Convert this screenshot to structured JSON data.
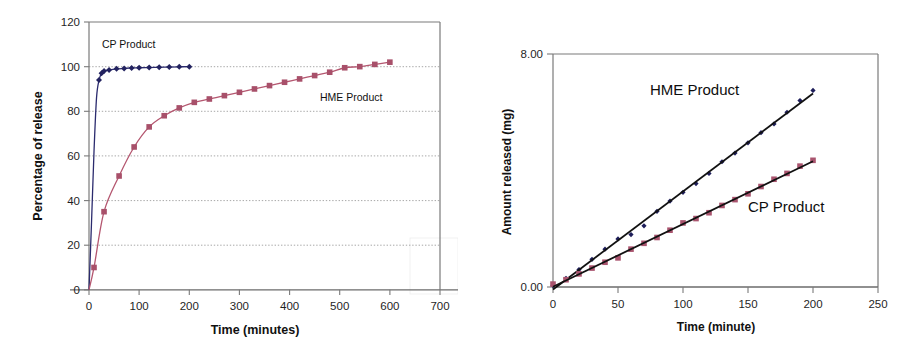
{
  "figure": {
    "panels": [
      "left-dissolution-percentage",
      "right-amount-released"
    ]
  },
  "chart_data": [
    {
      "id": "left",
      "type": "line",
      "title": "",
      "xlabel": "Time (minutes)",
      "ylabel": "Percentage of release",
      "xlim": [
        0,
        700
      ],
      "ylim": [
        0,
        120
      ],
      "xticks": [
        0,
        100,
        200,
        300,
        400,
        500,
        600,
        700
      ],
      "yticks": [
        0,
        20,
        40,
        60,
        80,
        100,
        120
      ],
      "grid": "horizontal-dotted",
      "legend": "inline-annotations",
      "annotations": [
        {
          "text": "CP Product",
          "x": 55,
          "y": 112
        },
        {
          "text": "HME Product",
          "x": 360,
          "y": 86
        }
      ],
      "series": [
        {
          "name": "CP Product",
          "color": "#232360",
          "marker": "diamond",
          "x": [
            0,
            5,
            10,
            15,
            20,
            25,
            30,
            40,
            55,
            70,
            85,
            100,
            120,
            140,
            160,
            180,
            200
          ],
          "y": [
            0,
            30,
            62,
            86,
            94,
            97,
            98,
            98.5,
            99,
            99.2,
            99.4,
            99.5,
            99.6,
            99.7,
            99.8,
            99.9,
            100
          ]
        },
        {
          "name": "HME Product",
          "color": "#a8506a",
          "marker": "square",
          "x": [
            0,
            10,
            30,
            60,
            90,
            120,
            150,
            180,
            210,
            240,
            270,
            300,
            330,
            360,
            390,
            420,
            450,
            480,
            510,
            540,
            570,
            600
          ],
          "y": [
            0,
            10,
            35,
            51,
            64,
            73,
            78,
            81.5,
            84,
            85.5,
            87,
            88.5,
            90,
            91.5,
            93,
            94.5,
            96,
            97.5,
            99.5,
            100,
            101,
            102
          ]
        }
      ]
    },
    {
      "id": "right",
      "type": "scatter-with-fit",
      "title": "",
      "xlabel": "Time (minute)",
      "ylabel": "Amount released (mg)",
      "xlim": [
        0,
        250
      ],
      "ylim": [
        0.0,
        8.0
      ],
      "xticks": [
        0,
        50,
        100,
        150,
        200,
        250
      ],
      "yticks": [
        "0.00",
        "8.00"
      ],
      "ytick_values": [
        0,
        8
      ],
      "grid": "none",
      "legend": "inline-annotations",
      "annotations": [
        {
          "text": "HME Product",
          "x": 105,
          "y": 6.9
        },
        {
          "text": "CP Product",
          "x": 160,
          "y": 2.6
        }
      ],
      "series": [
        {
          "name": "HME Product",
          "color": "#232360",
          "marker": "diamond",
          "fit_line": true,
          "x": [
            0,
            10,
            20,
            30,
            40,
            50,
            60,
            70,
            80,
            90,
            100,
            110,
            120,
            130,
            140,
            150,
            160,
            170,
            180,
            190,
            200
          ],
          "y": [
            0.05,
            0.3,
            0.6,
            0.95,
            1.3,
            1.65,
            1.8,
            2.1,
            2.6,
            2.95,
            3.25,
            3.55,
            3.9,
            4.3,
            4.6,
            4.95,
            5.3,
            5.6,
            6.0,
            6.4,
            6.75
          ]
        },
        {
          "name": "CP Product",
          "color": "#a8506a",
          "marker": "square",
          "fit_line": true,
          "x": [
            0,
            10,
            20,
            30,
            40,
            50,
            60,
            70,
            80,
            90,
            100,
            110,
            120,
            130,
            140,
            150,
            160,
            170,
            180,
            190,
            200
          ],
          "y": [
            0.1,
            0.25,
            0.45,
            0.65,
            0.85,
            1.0,
            1.3,
            1.5,
            1.7,
            1.95,
            2.2,
            2.35,
            2.55,
            2.8,
            3.0,
            3.2,
            3.45,
            3.7,
            3.9,
            4.15,
            4.35
          ]
        }
      ]
    }
  ],
  "left_chart": {
    "ylabel": "Percentage of release",
    "xlabel": "Time (minutes)",
    "yticks": [
      "0",
      "20",
      "40",
      "60",
      "80",
      "100",
      "120"
    ],
    "xticks": [
      "0",
      "100",
      "200",
      "300",
      "400",
      "500",
      "600",
      "700"
    ],
    "label_cp": "CP Product",
    "label_hme": "HME Product",
    "color_cp": "#232360",
    "color_hme": "#a8506a"
  },
  "right_chart": {
    "ylabel": "Amount released (mg)",
    "xlabel": "Time (minute)",
    "yticks": [
      "0.00",
      "8.00"
    ],
    "xticks": [
      "0",
      "50",
      "100",
      "150",
      "200",
      "250"
    ],
    "label_cp": "CP Product",
    "label_hme": "HME Product",
    "color_cp": "#232360",
    "color_hme": "#a8506a"
  }
}
